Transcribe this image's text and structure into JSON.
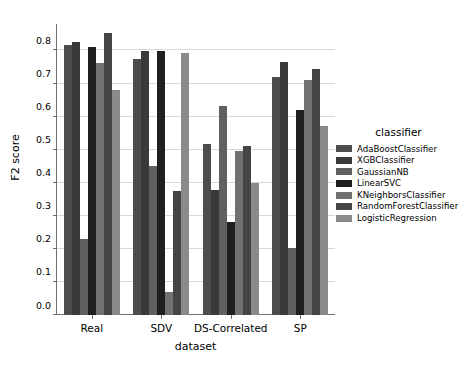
{
  "chart_data": {
    "type": "bar",
    "title": "",
    "xlabel": "dataset",
    "ylabel": "F2 score",
    "categories": [
      "Real",
      "SDV",
      "DS-Correlated",
      "SP"
    ],
    "ylim": [
      0.0,
      0.88
    ],
    "yticks": [
      0.0,
      0.1,
      0.2,
      0.3,
      0.4,
      0.5,
      0.6,
      0.7,
      0.8
    ],
    "ytick_labels": [
      "0.0",
      "0.1",
      "0.2",
      "0.3",
      "0.4",
      "0.5",
      "0.6",
      "0.7",
      "0.8"
    ],
    "grid": true,
    "grid_axis": "y",
    "legend_title": "classifier",
    "legend_position": "right",
    "series": [
      {
        "name": "AdaBoostClassifier",
        "color": "#4d4d4d",
        "values": [
          0.817,
          0.774,
          0.516,
          0.72
        ]
      },
      {
        "name": "XGBClassifier",
        "color": "#3a3a3a",
        "values": [
          0.826,
          0.798,
          0.378,
          0.766
        ]
      },
      {
        "name": "GaussianNB",
        "color": "#606060",
        "values": [
          0.231,
          0.45,
          0.633,
          0.202
        ]
      },
      {
        "name": "LinearSVC",
        "color": "#1f1f1f",
        "values": [
          0.811,
          0.798,
          0.28,
          0.62
        ]
      },
      {
        "name": "KNeighborsClassifier",
        "color": "#717171",
        "values": [
          0.761,
          0.07,
          0.496,
          0.71
        ]
      },
      {
        "name": "RandomForestClassifier",
        "color": "#454545",
        "values": [
          0.852,
          0.376,
          0.511,
          0.743
        ]
      },
      {
        "name": "LogisticRegression",
        "color": "#8a8a8a",
        "values": [
          0.68,
          0.791,
          0.4,
          0.571
        ]
      }
    ]
  }
}
